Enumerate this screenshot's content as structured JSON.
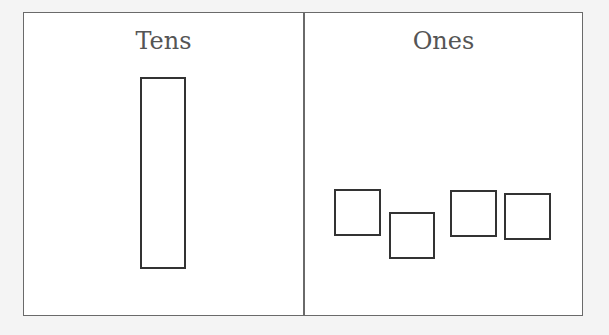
{
  "chart": {
    "columns": [
      {
        "title": "Tens",
        "count": 1
      },
      {
        "title": "Ones",
        "count": 4
      }
    ],
    "colors": {
      "border": "#6a6a6a",
      "block": "#333333",
      "title": "#555555"
    }
  }
}
